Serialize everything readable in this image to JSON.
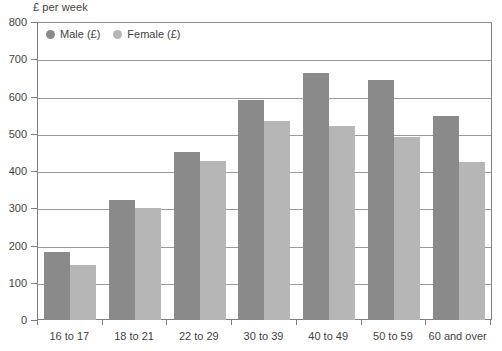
{
  "chart_data": {
    "type": "bar",
    "title": "",
    "subtitle": "",
    "xlabel": "",
    "ylabel": "£ per week",
    "ylim": [
      0,
      800
    ],
    "ytick_step": 100,
    "yticks": [
      0,
      100,
      200,
      300,
      400,
      500,
      600,
      700,
      800
    ],
    "ytick_labels": [
      "0",
      "100",
      "200",
      "300",
      "400",
      "500",
      "600",
      "700",
      "800"
    ],
    "grid": true,
    "legend_position": "top-left",
    "categories": [
      "16 to 17",
      "18 to 21",
      "22 to 29",
      "30 to 39",
      "40 to 49",
      "50 to 59",
      "60 and over"
    ],
    "series": [
      {
        "name": "Male (£)",
        "color": "#8a8a8a",
        "values": [
          182,
          322,
          452,
          590,
          662,
          645,
          548
        ]
      },
      {
        "name": "Female (£)",
        "color": "#b6b6b6",
        "values": [
          148,
          300,
          427,
          535,
          520,
          492,
          424
        ]
      }
    ]
  },
  "colors": {
    "male": "#8a8a8a",
    "female": "#b6b6b6",
    "gridline": "#9a9a9a",
    "frame": "#808080",
    "text": "#3f3f3f",
    "background": "#ffffff"
  }
}
